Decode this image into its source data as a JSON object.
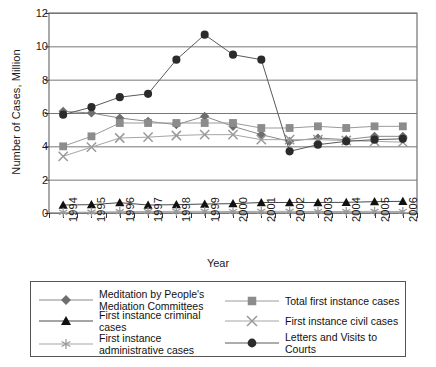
{
  "chart_data": {
    "type": "line",
    "title": "",
    "xlabel": "Year",
    "ylabel": "Number of Cases, Million",
    "categories": [
      1994,
      1995,
      1996,
      1997,
      1998,
      1999,
      2000,
      2001,
      2002,
      2003,
      2004,
      2005,
      2006
    ],
    "xtick_labels": [
      "1994",
      "1995",
      "1996",
      "1997",
      "1998",
      "1999",
      "2000",
      "2001",
      "2002",
      "2003",
      "2004",
      "2005",
      "2006"
    ],
    "ylim": [
      0,
      12
    ],
    "ytick_labels": [
      "0",
      "2",
      "4",
      "6",
      "8",
      "10",
      "12"
    ],
    "yticks": [
      0,
      2,
      4,
      6,
      8,
      10,
      12
    ],
    "grid": "horizontal",
    "legend_position": "bottom",
    "series": [
      {
        "name": "Meditation by People's Mediation Committees",
        "marker": "diamond",
        "color": "#6e6e6e",
        "line_color": "#8a8a8a",
        "values": [
          6.1,
          6.0,
          5.7,
          5.5,
          5.3,
          5.8,
          5.2,
          4.7,
          4.3,
          4.5,
          4.4,
          4.6,
          4.6
        ]
      },
      {
        "name": "Total first instance cases",
        "marker": "square",
        "color": "#8c8c8c",
        "line_color": "#9a9a9a",
        "values": [
          4.0,
          4.6,
          5.4,
          5.4,
          5.4,
          5.4,
          5.4,
          5.1,
          5.1,
          5.2,
          5.1,
          5.2,
          5.2
        ]
      },
      {
        "name": "First instance criminal cases",
        "marker": "triangle",
        "color": "#111111",
        "line_color": "#4a4a4a",
        "values": [
          0.48,
          0.5,
          0.62,
          0.48,
          0.5,
          0.54,
          0.56,
          0.63,
          0.63,
          0.63,
          0.64,
          0.68,
          0.7
        ]
      },
      {
        "name": "First instance civil cases",
        "marker": "x",
        "color": "#9a9a9a",
        "line_color": "#a5a5a5",
        "values": [
          3.4,
          3.95,
          4.5,
          4.55,
          4.65,
          4.7,
          4.7,
          4.4,
          4.4,
          4.4,
          4.35,
          4.3,
          4.25
        ]
      },
      {
        "name": "First instance administrative cases",
        "marker": "asterisk",
        "color": "#9a9a9a",
        "line_color": "#a5a5a5",
        "values": [
          0.04,
          0.05,
          0.08,
          0.09,
          0.1,
          0.1,
          0.09,
          0.1,
          0.1,
          0.09,
          0.09,
          0.1,
          0.09
        ]
      },
      {
        "name": "Letters and Visits to Courts",
        "marker": "circle",
        "color": "#2b2b2b",
        "line_color": "#5a5a5a",
        "values": [
          5.9,
          6.35,
          6.95,
          7.15,
          9.2,
          10.7,
          9.5,
          9.2,
          3.7,
          4.1,
          4.3,
          4.4,
          4.45
        ]
      }
    ]
  },
  "legend": {
    "entries": [
      {
        "label": "Meditation by People's Mediation Committees",
        "marker": "diamond",
        "name": "legend-mediation"
      },
      {
        "label": "Total first instance cases",
        "marker": "square",
        "name": "legend-total-first-instance"
      },
      {
        "label": "First instance criminal cases",
        "marker": "triangle",
        "name": "legend-criminal"
      },
      {
        "label": "First instance civil cases",
        "marker": "x",
        "name": "legend-civil"
      },
      {
        "label": "First instance administrative cases",
        "marker": "asterisk",
        "name": "legend-administrative"
      },
      {
        "label": "Letters and Visits to Courts",
        "marker": "circle",
        "name": "legend-letters-visits"
      }
    ]
  }
}
